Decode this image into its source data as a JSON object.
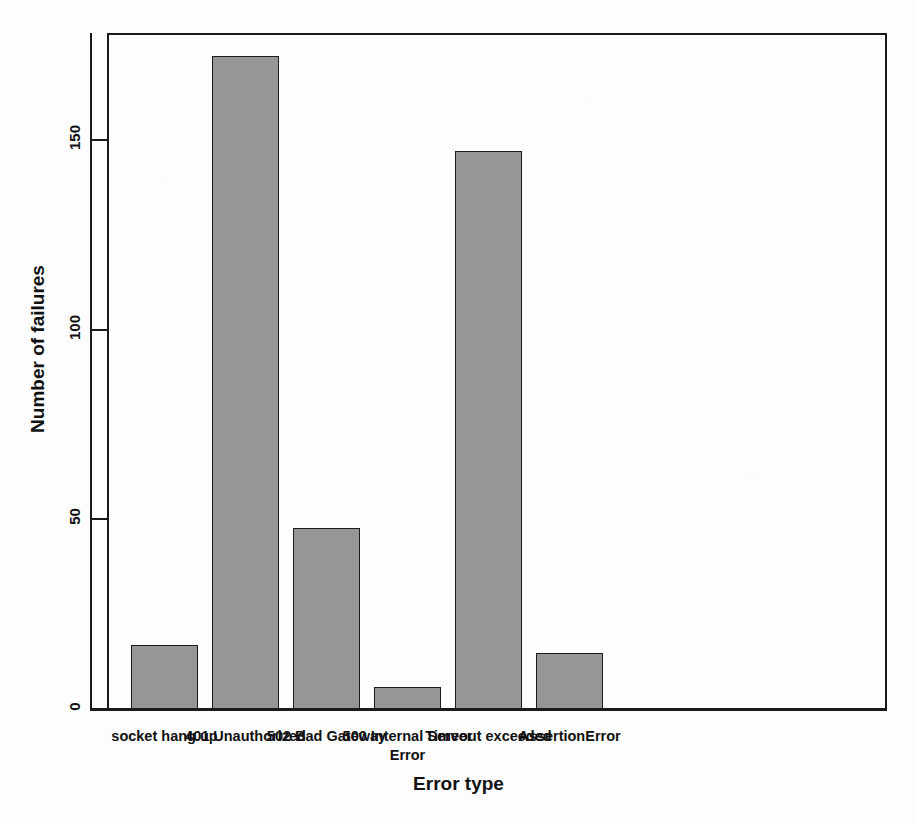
{
  "chart_data": {
    "type": "bar",
    "title": "",
    "subtitle": "",
    "xlabel": "Error type",
    "ylabel": "Number of failures",
    "categories": [
      "socket hang up",
      "401 Unauthorized",
      "502 Bad Gateway",
      "500 Internal Server Error",
      "Timeout exceeded",
      "AssertionError"
    ],
    "values": [
      17,
      172,
      48,
      6,
      147,
      15
    ],
    "ylim": [
      0,
      178
    ],
    "y_ticks": [
      0,
      50,
      100,
      150
    ],
    "y_tick_labels": [
      "0",
      "50",
      "100",
      "150"
    ],
    "grid": false,
    "legend": false,
    "bar_fill_color": "#969696",
    "bar_border_color": "#1c1c1c",
    "axis_color": "#1a1a1a",
    "background_color": "#fdfdfd"
  },
  "axis": {
    "y_title": "Number of failures",
    "x_title": "Error type"
  },
  "x_tick_labels": [
    {
      "line1": "socket hang up",
      "line2": ""
    },
    {
      "line1": "401 Unauthorized",
      "line2": ""
    },
    {
      "line1": "502 Bad Gateway",
      "line2": ""
    },
    {
      "line1": "500 Internal Server",
      "line2": "Error"
    },
    {
      "line1": "Timeout exceeded",
      "line2": ""
    },
    {
      "line1": "AssertionError",
      "line2": ""
    }
  ],
  "y_tick_labels": [
    "150",
    "100",
    "50",
    "0"
  ]
}
